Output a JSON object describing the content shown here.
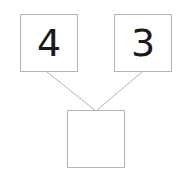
{
  "diagram": {
    "type": "number-bond",
    "canvas": {
      "width": 182,
      "height": 183,
      "background": "#ffffff"
    },
    "style": {
      "box_border_color": "#b5b5b5",
      "box_fill": "#ffffff",
      "line_color": "#b5b5b5",
      "digit_color": "#1a1a1a"
    },
    "boxes": {
      "addend_left": {
        "value": "4",
        "filled": true,
        "x": 20,
        "y": 14,
        "w": 58,
        "h": 58
      },
      "addend_right": {
        "value": "3",
        "filled": true,
        "x": 114,
        "y": 14,
        "w": 58,
        "h": 58
      },
      "sum": {
        "value": "",
        "filled": false,
        "x": 67,
        "y": 110,
        "w": 58,
        "h": 58
      }
    },
    "connectors": [
      {
        "name": "left-branch",
        "from": [
          47,
          72
        ],
        "to": [
          96,
          111
        ]
      },
      {
        "name": "right-branch",
        "from": [
          142,
          72
        ],
        "to": [
          96,
          111
        ]
      }
    ]
  }
}
